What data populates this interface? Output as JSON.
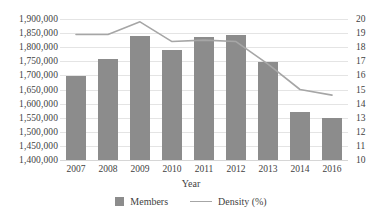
{
  "chart_data": {
    "type": "bar",
    "title": "",
    "xlabel": "Year",
    "ylabel": "",
    "categories": [
      "2007",
      "2008",
      "2009",
      "2010",
      "2011",
      "2012",
      "2013",
      "2014",
      "2016"
    ],
    "series": [
      {
        "name": "Members",
        "type": "bar",
        "axis": "left",
        "values": [
          1698000,
          1757000,
          1838000,
          1790000,
          1836000,
          1843000,
          1749000,
          1571000,
          1549000
        ]
      },
      {
        "name": "Density (%)",
        "type": "line",
        "axis": "right",
        "values": [
          18.9,
          18.9,
          19.8,
          18.4,
          18.5,
          18.4,
          16.8,
          15.0,
          14.6
        ]
      }
    ],
    "y_left": {
      "min": 1400000,
      "max": 1900000,
      "step": 50000,
      "ticks": [
        "1,900,000",
        "1,850,000",
        "1,800,000",
        "1,750,000",
        "1,700,000",
        "1,650,000",
        "1,600,000",
        "1,550,000",
        "1,500,000",
        "1,450,000",
        "1,400,000"
      ]
    },
    "y_right": {
      "min": 10,
      "max": 20,
      "step": 1,
      "ticks": [
        "20",
        "19",
        "18",
        "17",
        "16",
        "15",
        "14",
        "13",
        "12",
        "11",
        "10"
      ]
    },
    "legend": [
      {
        "label": "Members",
        "marker": "bar",
        "color": "#8c8c8c"
      },
      {
        "label": "Density (%)",
        "marker": "line",
        "color": "#a6a6a6"
      }
    ],
    "grid": true,
    "legend_position": "bottom",
    "colors": {
      "bar": "#8c8c8c",
      "line": "#a6a6a6",
      "grid": "#e4e4e4",
      "text": "#3f3f3f",
      "background": "#ffffff"
    }
  }
}
